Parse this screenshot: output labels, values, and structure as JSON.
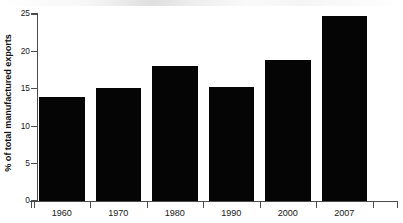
{
  "chart_data": {
    "type": "bar",
    "title": "",
    "subtitle": "",
    "xlabel": "",
    "ylabel": "% of total manufactured exports",
    "categories": [
      "1960",
      "1970",
      "1980",
      "1990",
      "2000",
      "2007"
    ],
    "values": [
      13.9,
      15.1,
      18.0,
      15.2,
      18.8,
      24.7
    ],
    "series": [
      {
        "name": "% of total manufactured exports",
        "values": [
          13.9,
          15.1,
          18.0,
          15.2,
          18.8,
          24.7
        ]
      }
    ],
    "ylim": [
      0,
      25
    ],
    "xlim_categories": 6,
    "yticks": [
      0,
      5,
      10,
      15,
      20,
      25
    ],
    "ytick_labels": [
      "0",
      "5",
      "10",
      "15",
      "20",
      "25"
    ],
    "xtick_labels": [
      "1960",
      "1970",
      "1980",
      "1990",
      "2000",
      "2007"
    ],
    "grid": false,
    "legend": null,
    "legend_position": "none",
    "annotations": [],
    "bar_color": "#050505",
    "axis_color": "#4b4b4b",
    "text_color": "#181818",
    "background_color": "#ffffff"
  },
  "axes": {
    "y_axis_title": "% of total manufactured exports",
    "y_ticks": [
      {
        "label": "25",
        "value": 25
      },
      {
        "label": "20",
        "value": 20
      },
      {
        "label": "15",
        "value": 15
      },
      {
        "label": "10",
        "value": 10
      },
      {
        "label": "5",
        "value": 5
      },
      {
        "label": "0",
        "value": 0
      }
    ],
    "x_ticks": [
      {
        "label": "1960"
      },
      {
        "label": "1970"
      },
      {
        "label": "1980"
      },
      {
        "label": "1990"
      },
      {
        "label": "2000"
      },
      {
        "label": "2007"
      }
    ]
  }
}
